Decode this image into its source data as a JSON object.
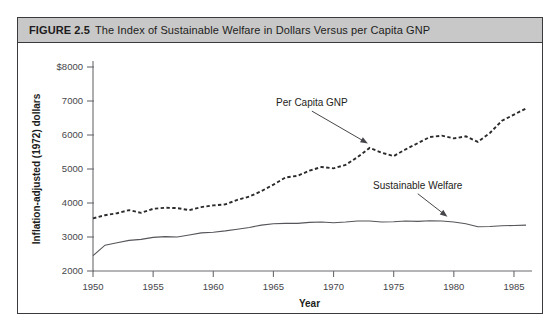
{
  "figure": {
    "number": "FIGURE 2.5",
    "caption": "The Index of Sustainable Welfare in Dollars Versus per Capita GNP"
  },
  "chart_data": {
    "type": "line",
    "title": "The Index of Sustainable Welfare in Dollars Versus per Capita GNP",
    "xlabel": "Year",
    "ylabel": "Inflation-adjusted (1972) dollars",
    "xlim": [
      1950,
      1986
    ],
    "ylim": [
      2000,
      8000
    ],
    "xticks": [
      1950,
      1955,
      1960,
      1965,
      1970,
      1975,
      1980,
      1985
    ],
    "xtick_labels": [
      "1950",
      "1955",
      "1960",
      "1965",
      "1970",
      "1975",
      "1980",
      "1985"
    ],
    "yticks": [
      2000,
      3000,
      4000,
      5000,
      6000,
      7000,
      8000
    ],
    "ytick_labels": [
      "2000",
      "3000",
      "4000",
      "5000",
      "6000",
      "7000",
      "$8000"
    ],
    "grid": false,
    "legend": "annotations-on-plot",
    "series": [
      {
        "name": "Per Capita GNP",
        "style": "dashed",
        "color": "#2b2b2e",
        "x": [
          1950,
          1951,
          1952,
          1953,
          1954,
          1955,
          1956,
          1957,
          1958,
          1959,
          1960,
          1961,
          1962,
          1963,
          1964,
          1965,
          1966,
          1967,
          1968,
          1969,
          1970,
          1971,
          1972,
          1973,
          1974,
          1975,
          1976,
          1977,
          1978,
          1979,
          1980,
          1981,
          1982,
          1983,
          1984,
          1985,
          1986
        ],
        "values": [
          3550,
          3640,
          3700,
          3790,
          3710,
          3830,
          3860,
          3850,
          3790,
          3880,
          3930,
          3960,
          4090,
          4190,
          4350,
          4540,
          4750,
          4800,
          4950,
          5060,
          5020,
          5120,
          5350,
          5620,
          5480,
          5380,
          5580,
          5760,
          5940,
          5980,
          5900,
          5960,
          5800,
          6060,
          6420,
          6600,
          6780
        ],
        "annotation": {
          "text": "Per Capita GNP",
          "label_x": 1968.2,
          "label_y": 6850,
          "arrow_to_x": 1973.0,
          "arrow_to_y": 5720
        }
      },
      {
        "name": "Sustainable Welfare",
        "style": "solid",
        "color": "#55555a",
        "x": [
          1950,
          1951,
          1952,
          1953,
          1954,
          1955,
          1956,
          1957,
          1958,
          1959,
          1960,
          1961,
          1962,
          1963,
          1964,
          1965,
          1966,
          1967,
          1968,
          1969,
          1970,
          1971,
          1972,
          1973,
          1974,
          1975,
          1976,
          1977,
          1978,
          1979,
          1980,
          1981,
          1982,
          1983,
          1984,
          1985,
          1986
        ],
        "values": [
          2450,
          2760,
          2830,
          2900,
          2930,
          2990,
          3010,
          3000,
          3060,
          3120,
          3140,
          3180,
          3230,
          3280,
          3350,
          3390,
          3400,
          3400,
          3430,
          3440,
          3420,
          3440,
          3470,
          3470,
          3440,
          3450,
          3470,
          3460,
          3480,
          3470,
          3440,
          3390,
          3300,
          3310,
          3330,
          3340,
          3350
        ],
        "annotation": {
          "text": "Sustainable Welfare",
          "label_x": 1977.0,
          "label_y": 4420,
          "arrow_to_x": 1979.6,
          "arrow_to_y": 3560
        }
      }
    ]
  }
}
